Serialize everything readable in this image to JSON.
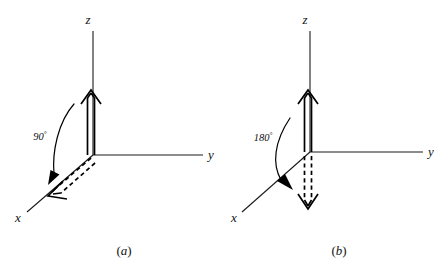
{
  "figure": {
    "background_color": "#ffffff",
    "ink_color": "#000000",
    "width": 445,
    "height": 267
  },
  "panels": [
    {
      "id": "panel-a",
      "caption": "(a)",
      "caption_open": "(",
      "caption_letter": "a",
      "caption_close": ")",
      "angle_value": "90",
      "angle_degree_symbol": "°",
      "angle_label": "90°",
      "axes": [
        {
          "name": "z",
          "label": "z",
          "direction": "up"
        },
        {
          "name": "y",
          "label": "y",
          "direction": "right"
        },
        {
          "name": "x",
          "label": "x",
          "direction": "lower-left"
        }
      ],
      "vectors": [
        {
          "name": "initial-vector",
          "style": "solid-hollow",
          "along_axis": "z",
          "description": "hollow double-line arrow pointing up along z"
        },
        {
          "name": "rotated-vector",
          "style": "dashed-hollow",
          "along_axis": "x",
          "description": "dashed hollow double-line arrow pointing down-left along x"
        }
      ],
      "rotation_arc": {
        "name": "rotation-arc",
        "from": "z",
        "to": "x",
        "amount": "90°",
        "direction": "clockwise-toward-x"
      }
    },
    {
      "id": "panel-b",
      "caption": "(b)",
      "caption_open": "(",
      "caption_letter": "b",
      "caption_close": ")",
      "angle_value": "180",
      "angle_degree_symbol": "°",
      "angle_label": "180°",
      "axes": [
        {
          "name": "z",
          "label": "z",
          "direction": "up"
        },
        {
          "name": "y",
          "label": "y",
          "direction": "right"
        },
        {
          "name": "x",
          "label": "x",
          "direction": "lower-left"
        }
      ],
      "vectors": [
        {
          "name": "initial-vector",
          "style": "solid-hollow",
          "along_axis": "z",
          "description": "hollow double-line arrow pointing up along z"
        },
        {
          "name": "rotated-vector",
          "style": "dashed-hollow",
          "along_axis": "minus-z",
          "description": "dashed hollow double-line arrow pointing straight down along negative z"
        }
      ],
      "rotation_arc": {
        "name": "rotation-arc",
        "from": "z",
        "to": "minus-z",
        "amount": "180°",
        "direction": "clockwise-through-x"
      }
    }
  ]
}
